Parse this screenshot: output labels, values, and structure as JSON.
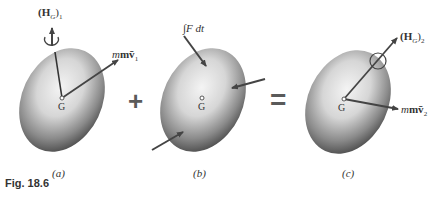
{
  "figure": {
    "caption": "Fig. 18.6",
    "panels": [
      {
        "id": "a",
        "label": "(a)",
        "center": "G",
        "vectors": {
          "angular_momentum": "(H",
          "angular_sub": "G",
          "angular_tail": ")",
          "angular_index": "1",
          "linear": "mv̄",
          "linear_index": "1"
        }
      },
      {
        "id": "b",
        "label": "(b)",
        "center": "G",
        "impulse": "∫F dt"
      },
      {
        "id": "c",
        "label": "(c)",
        "center": "G",
        "vectors": {
          "angular_momentum": "(H",
          "angular_sub": "G",
          "angular_tail": ")",
          "angular_index": "2",
          "linear": "mv̄",
          "linear_index": "2"
        }
      }
    ],
    "operators": {
      "plus": "+",
      "equals": "="
    }
  }
}
